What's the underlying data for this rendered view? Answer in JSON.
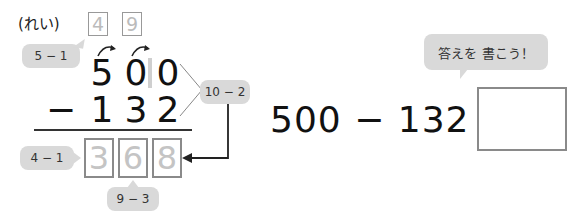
{
  "example_label": "(れい)",
  "borrow": {
    "boxes": [
      "4",
      "9"
    ],
    "hint_hundreds": "5 − 1"
  },
  "problem": {
    "top_digits": [
      "5",
      "0",
      "0"
    ],
    "operator": "−",
    "bottom_digits": [
      "1",
      "3",
      "2"
    ],
    "ones_hint": "10 − 2"
  },
  "answer": {
    "digits": [
      "3",
      "6",
      "8"
    ],
    "hint_hundreds": "4 − 1",
    "hint_tens": "9 − 3"
  },
  "exercise": {
    "equation": "500 − 132 =",
    "answer_value": "",
    "bubble_text": "答えを 書こう！",
    "furigana": [
      "こた",
      "か"
    ]
  },
  "colors": {
    "bubble": "#d9d9d9",
    "box_border": "#8a8a8a",
    "faded_digit": "#c4c4c4"
  }
}
